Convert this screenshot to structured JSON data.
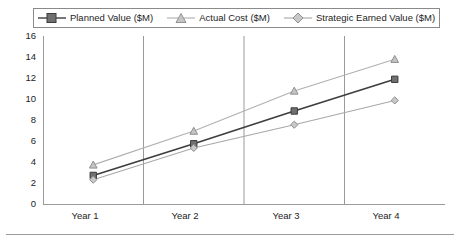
{
  "chart_data": {
    "type": "line",
    "title": "",
    "xlabel": "",
    "ylabel": "",
    "categories": [
      "Year 1",
      "Year 2",
      "Year 3",
      "Year 4"
    ],
    "ylim": [
      0,
      16
    ],
    "yticks": [
      0,
      2,
      4,
      6,
      8,
      10,
      12,
      14,
      16
    ],
    "grid": "vertical-category-separators",
    "legend_position": "top",
    "series": [
      {
        "name": "Planned Value ($M)",
        "marker": "square",
        "color": "#4a4a4a",
        "line_color": "#3d3d3d",
        "values": [
          2.8,
          5.8,
          8.9,
          11.9
        ]
      },
      {
        "name": "Actual Cost ($M)",
        "marker": "triangle",
        "color": "#a8a8a8",
        "line_color": "#b0b0b0",
        "values": [
          3.8,
          7.0,
          10.8,
          13.8
        ]
      },
      {
        "name": "Strategic Earned Value ($M)",
        "marker": "diamond",
        "color": "#9e9e9e",
        "line_color": "#a8a8a8",
        "values": [
          2.4,
          5.4,
          7.6,
          9.9
        ]
      }
    ]
  },
  "legend": {
    "items": [
      {
        "label": "Planned Value ($M)",
        "marker": "square-marker-icon"
      },
      {
        "label": "Actual Cost ($M)",
        "marker": "triangle-marker-icon"
      },
      {
        "label": "Strategic Earned Value ($M)",
        "marker": "diamond-marker-icon"
      }
    ]
  },
  "axes": {
    "y_labels": [
      "16",
      "14",
      "12",
      "10",
      "8",
      "6",
      "4",
      "2",
      "0"
    ],
    "x_labels": [
      "Year 1",
      "Year 2",
      "Year 3",
      "Year 4"
    ]
  }
}
